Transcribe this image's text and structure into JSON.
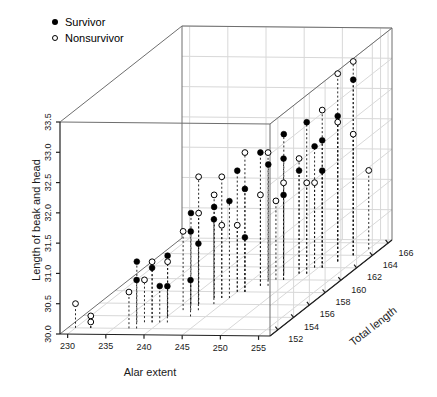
{
  "chart_data": {
    "type": "scatter",
    "projection": "3d",
    "title": "",
    "xlabel": "Alar extent",
    "ylabel": "Length of beak and head",
    "zlabel": "Total length",
    "xlim": [
      229.0,
      256.5
    ],
    "ylim": [
      30.0,
      33.5
    ],
    "zlim": [
      151.0,
      166.5
    ],
    "xticks": [
      230,
      235,
      240,
      245,
      250,
      255
    ],
    "yticks": [
      "30.0",
      "30.5",
      "31.0",
      "31.5",
      "32.0",
      "32.5",
      "33.0",
      "33.5"
    ],
    "ytick_values": [
      30.0,
      30.5,
      31.0,
      31.5,
      32.0,
      32.5,
      33.0,
      33.5
    ],
    "zticks": [
      152,
      154,
      156,
      158,
      160,
      162,
      164,
      166
    ],
    "grid": true,
    "legend_position": "top-left",
    "legend": [
      {
        "label": "Survivor",
        "marker": "filled-circle",
        "color": "#000000"
      },
      {
        "label": "Nonsurvivor",
        "marker": "open-circle",
        "color": "#000000"
      }
    ],
    "marker_color": "#000000",
    "dropline_style": "dashed",
    "series": [
      {
        "name": "Survivor",
        "marker": "filled-circle",
        "points": [
          {
            "x": 241,
            "y": 31.5,
            "z": 156
          },
          {
            "x": 240,
            "y": 31.0,
            "z": 154
          },
          {
            "x": 245,
            "y": 32.0,
            "z": 158
          },
          {
            "x": 243,
            "y": 31.5,
            "z": 157
          },
          {
            "x": 237,
            "y": 31.0,
            "z": 153
          },
          {
            "x": 240,
            "y": 30.6,
            "z": 153
          },
          {
            "x": 241,
            "y": 30.6,
            "z": 153
          },
          {
            "x": 243,
            "y": 30.6,
            "z": 154
          },
          {
            "x": 244,
            "y": 31.4,
            "z": 156
          },
          {
            "x": 246,
            "y": 31.7,
            "z": 158
          },
          {
            "x": 247,
            "y": 32.2,
            "z": 159
          },
          {
            "x": 247,
            "y": 31.9,
            "z": 160
          },
          {
            "x": 249,
            "y": 32.0,
            "z": 160
          },
          {
            "x": 251,
            "y": 32.5,
            "z": 161
          },
          {
            "x": 251,
            "y": 32.0,
            "z": 162
          },
          {
            "x": 252,
            "y": 32.1,
            "z": 162
          },
          {
            "x": 253,
            "y": 32.4,
            "z": 163
          },
          {
            "x": 254,
            "y": 32.9,
            "z": 164
          },
          {
            "x": 248,
            "y": 32.3,
            "z": 161
          },
          {
            "x": 250,
            "y": 31.7,
            "z": 161
          },
          {
            "x": 245,
            "y": 31.6,
            "z": 157
          },
          {
            "x": 242,
            "y": 31.3,
            "z": 155
          },
          {
            "x": 243,
            "y": 31.1,
            "z": 155
          },
          {
            "x": 246,
            "y": 30.9,
            "z": 158
          },
          {
            "x": 238,
            "y": 30.8,
            "z": 152
          },
          {
            "x": 239,
            "y": 30.9,
            "z": 153
          },
          {
            "x": 249,
            "y": 31.4,
            "z": 160
          },
          {
            "x": 252,
            "y": 31.6,
            "z": 162
          }
        ]
      },
      {
        "name": "Nonsurvivor",
        "marker": "open-circle",
        "points": [
          {
            "x": 230,
            "y": 30.4,
            "z": 152
          },
          {
            "x": 232,
            "y": 30.2,
            "z": 152
          },
          {
            "x": 232,
            "y": 30.1,
            "z": 152
          },
          {
            "x": 239,
            "y": 31.0,
            "z": 153
          },
          {
            "x": 238,
            "y": 30.7,
            "z": 153
          },
          {
            "x": 241,
            "y": 31.3,
            "z": 155
          },
          {
            "x": 242,
            "y": 31.5,
            "z": 156
          },
          {
            "x": 242,
            "y": 32.1,
            "z": 156
          },
          {
            "x": 243,
            "y": 31.7,
            "z": 157
          },
          {
            "x": 244,
            "y": 31.2,
            "z": 157
          },
          {
            "x": 246,
            "y": 32.3,
            "z": 158
          },
          {
            "x": 247,
            "y": 31.5,
            "z": 159
          },
          {
            "x": 248,
            "y": 31.3,
            "z": 160
          },
          {
            "x": 250,
            "y": 31.9,
            "z": 161
          },
          {
            "x": 251,
            "y": 31.5,
            "z": 161
          },
          {
            "x": 251,
            "y": 31.4,
            "z": 162
          },
          {
            "x": 252,
            "y": 32.6,
            "z": 162
          },
          {
            "x": 253,
            "y": 32.3,
            "z": 163
          },
          {
            "x": 253,
            "y": 33.1,
            "z": 163
          },
          {
            "x": 254,
            "y": 33.2,
            "z": 164
          },
          {
            "x": 254,
            "y": 32.0,
            "z": 164
          },
          {
            "x": 255,
            "y": 31.3,
            "z": 165
          },
          {
            "x": 249,
            "y": 31.6,
            "z": 160
          },
          {
            "x": 245,
            "y": 31.1,
            "z": 158
          },
          {
            "x": 240,
            "y": 30.9,
            "z": 154
          },
          {
            "x": 237,
            "y": 30.6,
            "z": 152
          },
          {
            "x": 244,
            "y": 32.0,
            "z": 157
          },
          {
            "x": 248,
            "y": 32.2,
            "z": 159
          }
        ]
      }
    ]
  },
  "labels": {
    "xlabel": "Alar extent",
    "ylabel": "Length of beak and head",
    "zlabel": "Total length"
  },
  "legend": {
    "survivor": "Survivor",
    "nonsurvivor": "Nonsurvivor"
  }
}
